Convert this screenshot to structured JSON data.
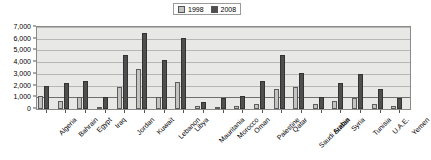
{
  "legend": {
    "position": "top-center",
    "entries": [
      {
        "label": "1998",
        "color": "#c3c3c1",
        "name": "legend-1998"
      },
      {
        "label": "2008",
        "color": "#4f4f4f",
        "name": "legend-2008"
      }
    ]
  },
  "axis": {
    "y_ticks": [
      "7,000",
      "6,000",
      "5,000",
      "4,000",
      "3,000",
      "2,000",
      "1,000",
      "0"
    ]
  },
  "chart_data": {
    "type": "bar",
    "title": "",
    "subtitle": "",
    "xlabel": "",
    "ylabel": "",
    "ylim": [
      0,
      7000
    ],
    "ytick_interval": 1000,
    "grid": true,
    "legend_position": "top-center",
    "categories": [
      "Algeria",
      "Bahrain",
      "Egypt",
      "Iraq",
      "Jordan",
      "Kuwait",
      "Lebanon",
      "Libya",
      "Mauritania",
      "Morocco",
      "Oman",
      "Palestine",
      "Qatar",
      "Saudi Arabia",
      "Sudan",
      "Syria",
      "Tunisia",
      "U.A.E.",
      "Yemen"
    ],
    "series": [
      {
        "name": "1998",
        "color": "#c3c3c1",
        "values": [
          1100,
          700,
          1000,
          150,
          1900,
          3400,
          1000,
          2300,
          300,
          150,
          250,
          450,
          1700,
          1900,
          400,
          700,
          900,
          400,
          250
        ]
      },
      {
        "name": "2008",
        "color": "#4f4f4f",
        "values": [
          2000,
          2200,
          2400,
          1000,
          4600,
          6500,
          4200,
          6100,
          600,
          900,
          1100,
          2400,
          4600,
          3100,
          1000,
          2200,
          3000,
          1700,
          900
        ]
      }
    ]
  }
}
